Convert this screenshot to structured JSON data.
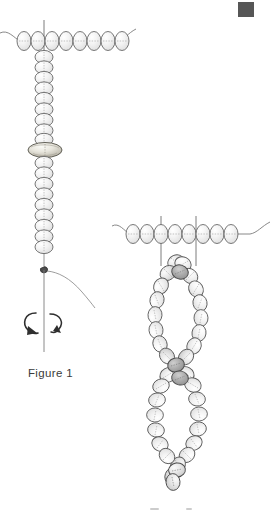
{
  "document": {
    "kind": "beading-instruction-illustration",
    "medium": "pencil line drawing",
    "background_color": "#ffffff",
    "ink_color": "#4a4a4a",
    "bead_fill_light": "#f2f2f2",
    "bead_fill_mid": "#d9d9d9",
    "bead_fill_dark": "#9e9e9e",
    "bead_outline": "#5c5c5c",
    "thread_color": "#6b6b6b",
    "corner_marker_color": "#565656"
  },
  "figures": [
    {
      "id": "figure-1",
      "caption": "Figure 1",
      "caption_x": 28,
      "caption_y": 368,
      "description": "A horizontal beaded thread with a vertical dangle strand of beads hanging from it; a wide flat spacer bead sits midway down the dangle, a knot with a loose thread tail is at the bottom, and a circular rotation arrow indicates twisting.",
      "horizontal_row": {
        "bead_count": 8,
        "y": 41,
        "x_start": 17,
        "bead_width": 14,
        "bead_height": 19,
        "thread_left_x": 0,
        "thread_right_x": 133
      },
      "vertical_strand": {
        "x": 44,
        "bead_count_above_spacer": 9,
        "bead_count_below_spacer": 9,
        "bead_width": 18,
        "bead_height": 13,
        "y_start": 52,
        "spacer_bead": {
          "label": "wide flat spacer bead",
          "y": 147,
          "width": 34,
          "height": 15
        }
      },
      "knot": {
        "x": 44,
        "y": 269,
        "label": "thread knot"
      },
      "thread_tail": {
        "label": "loose thread tail curving right"
      },
      "rotation_arrow": {
        "label": "twist direction arrow",
        "cx": 44,
        "cy": 323,
        "rx": 21,
        "ry": 11
      }
    },
    {
      "id": "figure-2",
      "caption": "",
      "description": "The finished twisted result: two beaded strands hanging from a horizontal beaded thread, spiralling around one another to form a series of elongated loops, with darker beads marking each crossing point.",
      "horizontal_row": {
        "bead_count": 8,
        "y": 234,
        "x_start": 126,
        "bead_width": 14,
        "bead_height": 19,
        "thread_left_x": 112,
        "thread_right_x": 270
      },
      "drop_lines": [
        {
          "x": 161,
          "y_top": 216,
          "y_bottom": 262
        },
        {
          "x": 196,
          "y_top": 216,
          "y_bottom": 262
        }
      ],
      "twisted_strands": {
        "strand_count": 2,
        "loop_count": 3,
        "crossing_points": 4,
        "center_x": 178,
        "y_top": 258,
        "y_bottom": 482,
        "bead_size": 15
      }
    }
  ],
  "corner_marker": {
    "label": "scan edge marker",
    "x": 238,
    "y": 2,
    "width": 16,
    "height": 15
  }
}
